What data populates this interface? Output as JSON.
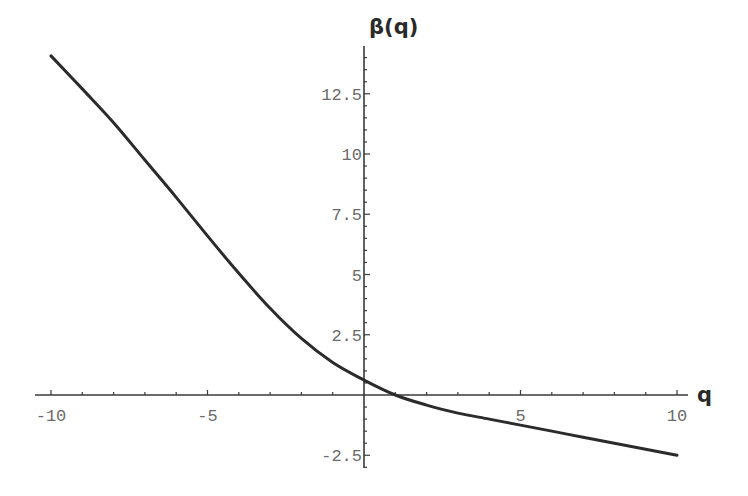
{
  "chart_data": {
    "type": "line",
    "title": "",
    "xlabel": "q",
    "ylabel": "β(q)",
    "xlim": [
      -10,
      10
    ],
    "ylim": [
      -2.5,
      14
    ],
    "x_ticks": [
      -10,
      -5,
      5,
      10
    ],
    "x_tick_labels": [
      "-10",
      "-5",
      "5",
      "10"
    ],
    "y_ticks": [
      -2.5,
      2.5,
      5,
      7.5,
      10,
      12.5
    ],
    "y_tick_labels": [
      "-2.5",
      "2.5",
      "5",
      "7.5",
      "10",
      "12.5"
    ],
    "grid": false,
    "legend": null,
    "series": [
      {
        "name": "β(q)",
        "color": "#2b2b2b",
        "x": [
          -10,
          -9,
          -8,
          -7,
          -6,
          -5,
          -4,
          -3,
          -2,
          -1,
          0,
          1,
          2,
          3,
          4,
          5,
          6,
          7,
          8,
          9,
          10
        ],
        "values": [
          14.07,
          12.7,
          11.3,
          9.75,
          8.2,
          6.6,
          5.05,
          3.6,
          2.35,
          1.35,
          0.62,
          0.0,
          -0.42,
          -0.75,
          -1.0,
          -1.25,
          -1.5,
          -1.75,
          -2.0,
          -2.25,
          -2.5
        ]
      }
    ]
  }
}
